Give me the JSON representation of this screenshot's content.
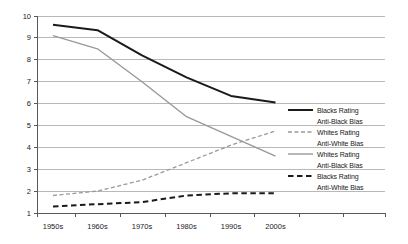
{
  "chart_data": {
    "type": "line",
    "categories": [
      "1950s",
      "1960s",
      "1970s",
      "1980s",
      "1990s",
      "2000s"
    ],
    "series": [
      {
        "name": "Blacks Rating Anti-Black Bias",
        "legend_lines": [
          "Blacks Rating",
          "Anti-Black Bias"
        ],
        "color": "#1a1a1a",
        "style": "solid",
        "width": 2,
        "values": [
          9.6,
          9.35,
          8.2,
          7.2,
          6.35,
          6.05
        ]
      },
      {
        "name": "Whites Rating Anti-White Bias",
        "legend_lines": [
          "Whites Rating",
          "Anti-White Bias"
        ],
        "color": "#999999",
        "style": "dashed",
        "width": 1.3,
        "dash": "4,2.5",
        "values": [
          1.8,
          2.0,
          2.5,
          3.3,
          4.1,
          4.75
        ]
      },
      {
        "name": "Whites Rating Anti-Black Bias",
        "legend_lines": [
          "Whites Rating",
          "Anti-Black Bias"
        ],
        "color": "#999999",
        "style": "solid",
        "width": 1.4,
        "values": [
          9.1,
          8.5,
          7.0,
          5.4,
          4.5,
          3.6
        ]
      },
      {
        "name": "Blacks Rating Anti-White Bias",
        "legend_lines": [
          "Blacks Rating",
          "Anti-White Bias"
        ],
        "color": "#1a1a1a",
        "style": "dashed",
        "width": 2,
        "dash": "5.5,3.5",
        "values": [
          1.3,
          1.4,
          1.5,
          1.8,
          1.9,
          1.9
        ]
      }
    ],
    "ylim": [
      1,
      10
    ],
    "yticks": [
      1,
      2,
      3,
      4,
      5,
      6,
      7,
      8,
      9,
      10
    ],
    "grid": true,
    "legend_position": "right-inside",
    "colors": {
      "grid": "#b8b8b8",
      "axis": "#595959",
      "text": "#1a1a1a",
      "background": "#ffffff"
    }
  }
}
